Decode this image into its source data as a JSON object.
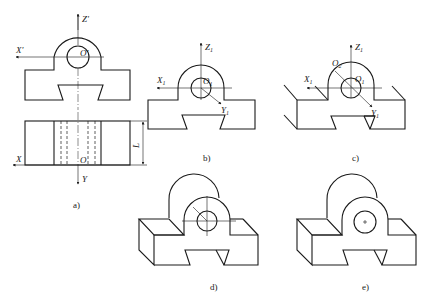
{
  "figure": {
    "panels": [
      {
        "id": "a",
        "caption": "a)",
        "axis_labels": {
          "z": "Z'",
          "x_top": "X'",
          "origin_top": "O'",
          "x_bottom": "X",
          "origin_bottom": "O",
          "y": "Y",
          "dim": "L"
        }
      },
      {
        "id": "b",
        "caption": "b)",
        "axis_labels": {
          "z": "Z",
          "x": "X",
          "origin": "O",
          "y": "Y",
          "sub": "1"
        }
      },
      {
        "id": "c",
        "caption": "c)",
        "axis_labels": {
          "z": "Z",
          "x": "X",
          "origin1": "O",
          "origin2": "O",
          "y": "Y",
          "sub1": "1",
          "sub2": "2"
        }
      },
      {
        "id": "d",
        "caption": "d)"
      },
      {
        "id": "e",
        "caption": "e)"
      }
    ],
    "line_color": "#1a1a1a",
    "background": "#ffffff"
  }
}
